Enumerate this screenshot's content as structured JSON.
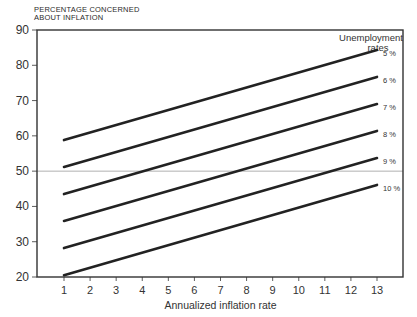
{
  "chart_data": {
    "type": "line",
    "title": "",
    "ylabel": "PERCENTAGE CONCERNED ABOUT INFLATION",
    "ylabel_lines": [
      "PERCENTAGE CONCERNED",
      "ABOUT INFLATION"
    ],
    "xlabel": "Annualized inflation rate",
    "xlim": [
      0,
      14
    ],
    "ylim": [
      20,
      90
    ],
    "x_ticks": [
      1,
      2,
      3,
      4,
      5,
      6,
      7,
      8,
      9,
      10,
      11,
      12,
      13
    ],
    "y_ticks": [
      20,
      30,
      40,
      50,
      60,
      70,
      80,
      90
    ],
    "grid": false,
    "reference_line": {
      "y": 50,
      "style": "thin gray horizontal"
    },
    "legend": {
      "title_lines": [
        "Unemployment",
        "rates"
      ],
      "position": "top-right, labels at line ends"
    },
    "x": [
      1,
      13
    ],
    "series": [
      {
        "name": "5 %",
        "values": [
          58.8,
          84.3
        ]
      },
      {
        "name": "6 %",
        "values": [
          51.2,
          76.7
        ]
      },
      {
        "name": "7 %",
        "values": [
          43.5,
          69.0
        ]
      },
      {
        "name": "8 %",
        "values": [
          35.9,
          61.4
        ]
      },
      {
        "name": "9 %",
        "values": [
          28.2,
          53.7
        ]
      },
      {
        "name": "10 %",
        "values": [
          20.5,
          46.1
        ]
      }
    ]
  }
}
